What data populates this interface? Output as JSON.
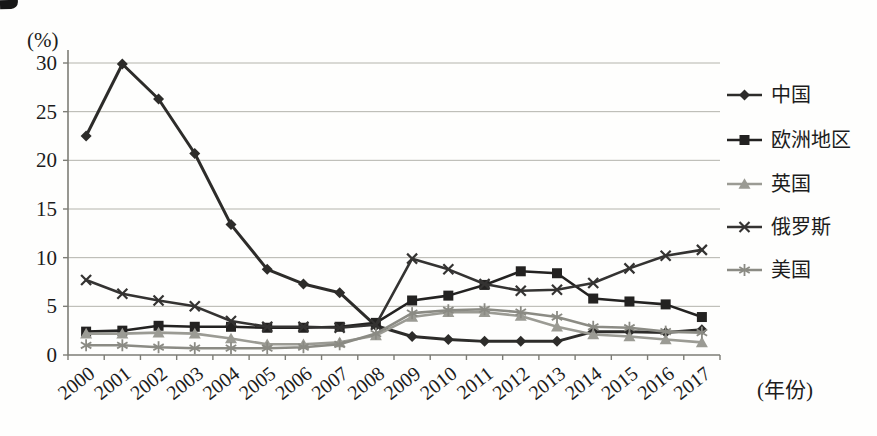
{
  "axis": {
    "y_unit_label": "(%)",
    "x_unit_label": "(年份)"
  },
  "colors": {
    "dark_line": "#2d2c2a",
    "gray_line": "#93938c",
    "gridline": "#b4b4ac",
    "axis_line": "#7d7d76",
    "text": "#1c1c1c"
  },
  "chart_data": {
    "type": "line",
    "title": "",
    "xlabel": "(年份)",
    "ylabel": "(%)",
    "categories": [
      "2000",
      "2001",
      "2002",
      "2003",
      "2004",
      "2005",
      "2006",
      "2007",
      "2008",
      "2009",
      "2010",
      "2011",
      "2012",
      "2013",
      "2014",
      "2015",
      "2016",
      "2017"
    ],
    "ylim": [
      0,
      30
    ],
    "yticks": [
      0,
      5,
      10,
      15,
      20,
      25,
      30
    ],
    "grid": "horizontal",
    "legend_position": "right",
    "series": [
      {
        "key": "china",
        "label": "中国",
        "marker": "diamond",
        "color": "#2d2c2a",
        "values": [
          22.5,
          29.9,
          26.3,
          20.7,
          13.4,
          8.8,
          7.3,
          6.4,
          3.0,
          1.9,
          1.6,
          1.4,
          1.4,
          1.4,
          2.4,
          2.4,
          2.3,
          2.6
        ]
      },
      {
        "key": "europe",
        "label": "欧洲地区",
        "marker": "square",
        "color": "#232221",
        "values": [
          2.4,
          2.5,
          3.0,
          2.9,
          2.9,
          2.8,
          2.8,
          2.9,
          3.3,
          5.6,
          6.1,
          7.2,
          8.6,
          8.4,
          5.8,
          5.5,
          5.2,
          3.9
        ]
      },
      {
        "key": "uk",
        "label": "英国",
        "marker": "triangle",
        "color": "#9b9b94",
        "values": [
          2.2,
          2.2,
          2.3,
          2.2,
          1.7,
          1.1,
          1.1,
          1.3,
          2.0,
          3.9,
          4.4,
          4.4,
          4.0,
          2.9,
          2.1,
          1.9,
          1.6,
          1.3
        ]
      },
      {
        "key": "russia",
        "label": "俄罗斯",
        "marker": "x",
        "color": "#343332",
        "values": [
          7.7,
          6.3,
          5.6,
          5.0,
          3.5,
          2.9,
          2.9,
          2.8,
          3.1,
          9.9,
          8.8,
          7.3,
          6.6,
          6.7,
          7.4,
          8.9,
          10.2,
          10.8
        ]
      },
      {
        "key": "usa",
        "label": "美国",
        "marker": "asterisk",
        "color": "#8b8b84",
        "values": [
          1.0,
          1.0,
          0.8,
          0.7,
          0.7,
          0.7,
          0.8,
          1.1,
          2.2,
          4.3,
          4.6,
          4.7,
          4.4,
          3.9,
          2.9,
          2.8,
          2.4,
          2.3
        ]
      }
    ]
  }
}
